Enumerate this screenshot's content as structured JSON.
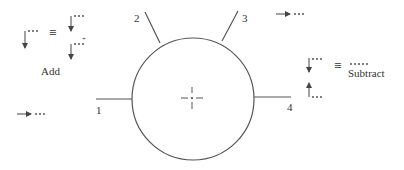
{
  "diagram": {
    "port_labels": [
      "1",
      "2",
      "3",
      "4"
    ],
    "legend": {
      "add_label": "Add",
      "subtract_label": "Subtract",
      "equiv_symbol": "≡",
      "plus_symbol": "+",
      "dots": "···",
      "long_dots": "·····"
    },
    "colors": {
      "line": "#555555",
      "text": "#333333",
      "background": "#ffffff"
    }
  }
}
